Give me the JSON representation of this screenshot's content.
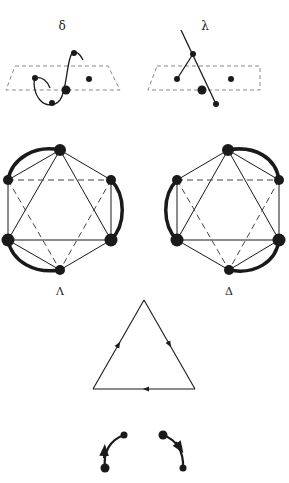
{
  "labels": {
    "delta_small": "δ",
    "lambda_small": "λ",
    "lambda_big": "Λ",
    "delta_big": "Δ"
  },
  "panels": {
    "top_left": {
      "label": "δ",
      "description": "curved strand through dashed plane with dots"
    },
    "top_right": {
      "label": "λ",
      "description": "straight strand through dashed plane with dots"
    },
    "hex_left": {
      "label": "Λ",
      "description": "hexagonal node graph with thick arcs (left-handed)"
    },
    "hex_right": {
      "label": "Δ",
      "description": "hexagonal node graph with thick arcs (right-handed)"
    },
    "triangle": {
      "description": "triangle with directional arrows on each edge"
    },
    "arcs": {
      "description": "two curved arrows between dot pairs"
    }
  },
  "colors": {
    "ink": "#1a1a1a",
    "dash": "#777777",
    "background": "#ffffff"
  }
}
